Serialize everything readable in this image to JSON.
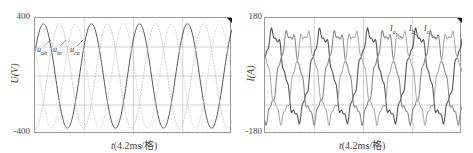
{
  "chart_data": [
    {
      "type": "line",
      "title": "",
      "xlabel": "t(4.2ms/格)",
      "ylabel": "U(V)",
      "ylim": [
        -400,
        400
      ],
      "yticks": [
        "400",
        "-400"
      ],
      "grid": true,
      "grid_divisions": {
        "x": 4,
        "y": 4
      },
      "x_unit_per_div": "4.2ms",
      "legend_position": "inline annotations, upper-left",
      "series": [
        {
          "name": "u_ab",
          "label_main": "u",
          "label_sub": "ab",
          "amplitude": 360,
          "phase_deg": 0,
          "cycles_shown": 4.1,
          "color": "#555555"
        },
        {
          "name": "u_bc",
          "label_main": "u",
          "label_sub": "bc",
          "amplitude": 360,
          "phase_deg": -120,
          "cycles_shown": 4.1,
          "color": "#bdbdbd"
        },
        {
          "name": "u_ca",
          "label_main": "u",
          "label_sub": "ca",
          "amplitude": 360,
          "phase_deg": 120,
          "cycles_shown": 4.1,
          "color": "#cfcfcf"
        }
      ]
    },
    {
      "type": "line",
      "title": "",
      "xlabel": "t(4.2ms/格)",
      "ylabel": "I(A)",
      "ylim": [
        -180,
        180
      ],
      "yticks": [
        "180",
        "-180"
      ],
      "grid": true,
      "grid_divisions": {
        "x": 4,
        "y": 4
      },
      "x_unit_per_div": "4.2ms",
      "legend_position": "inline annotations, upper-right",
      "series": [
        {
          "name": "I_a",
          "label_main": "I",
          "label_sub": "a",
          "amplitude": 130,
          "phase_deg": 0,
          "cycles_shown": 4.1,
          "color": "#555555"
        },
        {
          "name": "I_b",
          "label_main": "I",
          "label_sub": "b",
          "amplitude": 130,
          "phase_deg": -120,
          "cycles_shown": 4.1,
          "color": "#8a8a8a"
        },
        {
          "name": "I_c",
          "label_main": "I",
          "label_sub": "c",
          "amplitude": 130,
          "phase_deg": 120,
          "cycles_shown": 4.1,
          "color": "#b0b0b0"
        }
      ]
    }
  ],
  "left": {
    "ytick_top": "400",
    "ytick_bottom": "-400",
    "ylabel": "U(V)",
    "xlabel_var": "t",
    "xlabel_rest": "(4.2ms/格)",
    "annotations": [
      {
        "main": "u",
        "sub": "ab"
      },
      {
        "main": "u",
        "sub": "bc"
      },
      {
        "main": "u",
        "sub": "ca"
      }
    ]
  },
  "right": {
    "ytick_top": "180",
    "ytick_bottom": "-180",
    "ylabel": "I(A)",
    "xlabel_var": "t",
    "xlabel_rest": "(4.2ms/格)",
    "annotations": [
      {
        "main": "I",
        "sub": "a"
      },
      {
        "main": "I",
        "sub": "b"
      },
      {
        "main": "I",
        "sub": "c"
      }
    ]
  }
}
